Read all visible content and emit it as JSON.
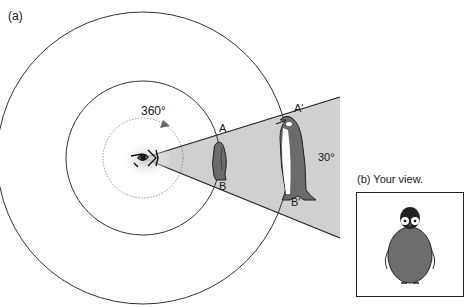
{
  "panel_a": {
    "label": "(a)",
    "rotation_label": "360°",
    "angle_label": "30°",
    "points": {
      "A": "A",
      "B": "B",
      "A_prime": "A'",
      "B_prime": "B'"
    }
  },
  "panel_b": {
    "label": "(b) Your view."
  },
  "colors": {
    "cone_fill": "#d0d0d0",
    "line": "#222222",
    "penguin_body": "#6b6b6b",
    "background": "#ffffff"
  }
}
